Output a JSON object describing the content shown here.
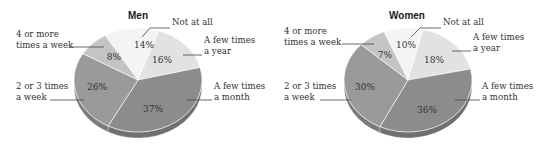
{
  "chart_data": [
    {
      "type": "pie",
      "title": "Men",
      "categories": [
        "Not at all",
        "A few times a year",
        "A few times a month",
        "2 or 3 times a week",
        "4 or more times a week"
      ],
      "values": [
        14,
        16,
        37,
        26,
        8
      ],
      "value_labels": [
        "14%",
        "16%",
        "37%",
        "26%",
        "8%"
      ],
      "label_lines": [
        [
          "Not at all"
        ],
        [
          "A few times",
          "a year"
        ],
        [
          "A few times",
          "a month"
        ],
        [
          "2 or 3 times",
          "a week"
        ],
        [
          "4 or more",
          "times a week"
        ]
      ],
      "colors": [
        "#f4f4f4",
        "#e2e2e2",
        "#8c8c8c",
        "#9a9a9a",
        "#c4c4c4"
      ]
    },
    {
      "type": "pie",
      "title": "Women",
      "categories": [
        "Not at all",
        "A few times a year",
        "A few times a month",
        "2 or 3 times a week",
        "4 or more times a week"
      ],
      "values": [
        10,
        18,
        36,
        30,
        7
      ],
      "value_labels": [
        "10%",
        "18%",
        "36%",
        "30%",
        "7%"
      ],
      "label_lines": [
        [
          "Not at all"
        ],
        [
          "A few times",
          "a year"
        ],
        [
          "A few times",
          "a month"
        ],
        [
          "2 or 3 times",
          "a week"
        ],
        [
          "4 or more",
          "times a week"
        ]
      ],
      "colors": [
        "#f4f4f4",
        "#e2e2e2",
        "#8c8c8c",
        "#9a9a9a",
        "#c4c4c4"
      ]
    }
  ]
}
